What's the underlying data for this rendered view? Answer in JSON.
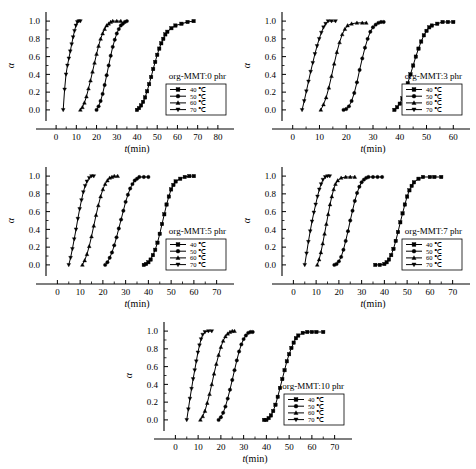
{
  "figure": {
    "axis_titles": {
      "x": "t(min)",
      "y": "α"
    },
    "x_unit_italic_prefix": "t",
    "panel_count": 5
  },
  "chart_data": [
    {
      "type": "line",
      "title": "org-MMT:0 phr",
      "xlabel": "t(min)",
      "ylabel": "α",
      "xlim": [
        -5,
        85
      ],
      "ylim": [
        -0.08,
        1.08
      ],
      "xticks": [
        0,
        10,
        20,
        30,
        40,
        50,
        60,
        70,
        80
      ],
      "yticks": [
        0.0,
        0.2,
        0.4,
        0.6,
        0.8,
        1.0
      ],
      "grid": false,
      "legend_position": "lower-right",
      "series": [
        {
          "name": "40 ℃",
          "marker": "square",
          "x": [
            40,
            41,
            42,
            43,
            44,
            45,
            46,
            47,
            48,
            49,
            50,
            51,
            52,
            53,
            54,
            55,
            57,
            59,
            62,
            65,
            68
          ],
          "y": [
            0.0,
            0.02,
            0.05,
            0.09,
            0.14,
            0.21,
            0.29,
            0.37,
            0.46,
            0.54,
            0.62,
            0.69,
            0.75,
            0.8,
            0.85,
            0.88,
            0.92,
            0.95,
            0.97,
            0.99,
            1.0
          ]
        },
        {
          "name": "50 ℃",
          "marker": "circle",
          "x": [
            20,
            21,
            22,
            23,
            24,
            25,
            26,
            27,
            28,
            29,
            30,
            31,
            32,
            33,
            34,
            35
          ],
          "y": [
            0.0,
            0.04,
            0.1,
            0.18,
            0.28,
            0.39,
            0.5,
            0.61,
            0.71,
            0.79,
            0.86,
            0.91,
            0.95,
            0.97,
            0.99,
            1.0
          ]
        },
        {
          "name": "60 ℃",
          "marker": "triangle-up",
          "x": [
            12,
            13,
            14,
            15,
            16,
            17,
            18,
            19,
            20,
            21,
            22,
            23,
            24,
            25,
            26,
            27,
            28,
            30,
            32
          ],
          "y": [
            0.0,
            0.03,
            0.08,
            0.15,
            0.24,
            0.33,
            0.43,
            0.53,
            0.63,
            0.72,
            0.8,
            0.86,
            0.91,
            0.95,
            0.97,
            0.99,
            1.0,
            1.0,
            1.0
          ]
        },
        {
          "name": "70 ℃",
          "marker": "triangle-down",
          "x": [
            3.5,
            4.2,
            4.9,
            5.6,
            6.3,
            7.0,
            7.7,
            8.4,
            9.1,
            9.8,
            10.5,
            11.2,
            12.0
          ],
          "y": [
            0.0,
            0.23,
            0.4,
            0.5,
            0.58,
            0.66,
            0.74,
            0.82,
            0.89,
            0.95,
            0.99,
            1.0,
            1.0
          ]
        }
      ]
    },
    {
      "type": "line",
      "title": "org-MMT:3 phr",
      "xlabel": "t(min)",
      "ylabel": "α",
      "xlim": [
        -4,
        64
      ],
      "ylim": [
        -0.08,
        1.08
      ],
      "xticks": [
        0,
        10,
        20,
        30,
        40,
        50,
        60
      ],
      "yticks": [
        0.0,
        0.2,
        0.4,
        0.6,
        0.8,
        1.0
      ],
      "grid": false,
      "legend_position": "lower-right",
      "series": [
        {
          "name": "40 ℃",
          "marker": "square",
          "x": [
            38,
            39,
            40,
            41,
            42,
            43,
            44,
            45,
            46,
            47,
            48,
            49,
            50,
            51,
            52,
            54,
            56,
            58,
            60
          ],
          "y": [
            0.0,
            0.03,
            0.07,
            0.13,
            0.21,
            0.3,
            0.4,
            0.5,
            0.6,
            0.69,
            0.77,
            0.84,
            0.89,
            0.93,
            0.95,
            0.97,
            0.99,
            0.99,
            0.99
          ]
        },
        {
          "name": "50 ℃",
          "marker": "circle",
          "x": [
            19,
            20,
            21,
            22,
            23,
            24,
            25,
            26,
            27,
            28,
            29,
            30,
            31,
            32,
            33,
            34
          ],
          "y": [
            0.0,
            0.01,
            0.04,
            0.1,
            0.19,
            0.31,
            0.45,
            0.58,
            0.7,
            0.8,
            0.88,
            0.93,
            0.96,
            0.98,
            0.99,
            0.99
          ]
        },
        {
          "name": "60 ℃",
          "marker": "triangle-up",
          "x": [
            10.5,
            11.5,
            12.5,
            13.5,
            14.5,
            15.5,
            16.5,
            17.5,
            18.5,
            19.5,
            20.5,
            22,
            24,
            26,
            27.5
          ],
          "y": [
            0.0,
            0.06,
            0.14,
            0.25,
            0.38,
            0.52,
            0.65,
            0.76,
            0.85,
            0.91,
            0.95,
            0.97,
            0.98,
            0.98,
            0.98
          ]
        },
        {
          "name": "70 ℃",
          "marker": "triangle-down",
          "x": [
            3.5,
            4.3,
            5.1,
            5.9,
            6.7,
            7.5,
            8.3,
            9.1,
            9.9,
            10.7,
            11.5,
            12.3,
            13.2,
            14.5,
            16
          ],
          "y": [
            0.0,
            0.1,
            0.21,
            0.32,
            0.43,
            0.53,
            0.63,
            0.72,
            0.8,
            0.87,
            0.93,
            0.97,
            1.0,
            1.0,
            1.0
          ]
        }
      ]
    },
    {
      "type": "line",
      "title": "org-MMT:5 phr",
      "xlabel": "t(min)",
      "ylabel": "α",
      "xlim": [
        -5,
        75
      ],
      "ylim": [
        -0.08,
        1.08
      ],
      "xticks": [
        0,
        10,
        20,
        30,
        40,
        50,
        60,
        70
      ],
      "yticks": [
        0.0,
        0.2,
        0.4,
        0.6,
        0.8,
        1.0
      ],
      "grid": false,
      "legend_position": "lower-right",
      "series": [
        {
          "name": "40 ℃",
          "marker": "square",
          "x": [
            38,
            39,
            40,
            41,
            42,
            43,
            44,
            45,
            46,
            47,
            48,
            49,
            50,
            51,
            52,
            54,
            56,
            58,
            60
          ],
          "y": [
            0.0,
            0.01,
            0.03,
            0.06,
            0.11,
            0.17,
            0.25,
            0.35,
            0.46,
            0.57,
            0.68,
            0.77,
            0.85,
            0.9,
            0.94,
            0.97,
            0.99,
            1.0,
            1.0
          ]
        },
        {
          "name": "50 ℃",
          "marker": "circle",
          "x": [
            21,
            22,
            23,
            24,
            25,
            26,
            27,
            28,
            29,
            30,
            31,
            32,
            33,
            34,
            35,
            36,
            38,
            40
          ],
          "y": [
            0.0,
            0.03,
            0.08,
            0.14,
            0.22,
            0.31,
            0.41,
            0.51,
            0.61,
            0.71,
            0.79,
            0.86,
            0.91,
            0.95,
            0.97,
            0.99,
            0.99,
            0.99
          ]
        },
        {
          "name": "60 ℃",
          "marker": "triangle-up",
          "x": [
            11,
            12,
            13,
            14,
            15,
            16,
            17,
            18,
            19,
            20,
            21,
            22,
            23,
            24,
            25,
            26.5
          ],
          "y": [
            0.0,
            0.05,
            0.12,
            0.21,
            0.32,
            0.44,
            0.56,
            0.67,
            0.77,
            0.85,
            0.91,
            0.95,
            0.98,
            0.99,
            1.0,
            1.0
          ]
        },
        {
          "name": "70 ℃",
          "marker": "triangle-down",
          "x": [
            5,
            5.8,
            6.6,
            7.4,
            8.2,
            9.0,
            9.8,
            10.6,
            11.4,
            12.2,
            13.0,
            14.0,
            15.0,
            16.0
          ],
          "y": [
            0.0,
            0.08,
            0.18,
            0.29,
            0.4,
            0.52,
            0.63,
            0.73,
            0.82,
            0.89,
            0.94,
            0.98,
            1.0,
            1.0
          ]
        }
      ]
    },
    {
      "type": "line",
      "title": "org-MMT:7 phr",
      "xlabel": "t(min)",
      "ylabel": "α",
      "xlim": [
        -5,
        75
      ],
      "ylim": [
        -0.08,
        1.08
      ],
      "xticks": [
        0,
        10,
        20,
        30,
        40,
        50,
        60,
        70
      ],
      "yticks": [
        0.0,
        0.2,
        0.4,
        0.6,
        0.8,
        1.0
      ],
      "grid": false,
      "legend_position": "lower-right",
      "series": [
        {
          "name": "40 ℃",
          "marker": "square",
          "x": [
            36,
            38,
            40,
            41,
            42,
            43,
            44,
            45,
            46,
            47,
            48,
            49,
            50,
            51,
            52,
            53,
            55,
            57,
            60,
            62,
            65
          ],
          "y": [
            0.0,
            0.0,
            0.01,
            0.03,
            0.06,
            0.11,
            0.18,
            0.27,
            0.37,
            0.48,
            0.58,
            0.68,
            0.77,
            0.84,
            0.89,
            0.93,
            0.97,
            0.99,
            0.99,
            0.99,
            0.99
          ]
        },
        {
          "name": "50 ℃",
          "marker": "circle",
          "x": [
            18,
            19,
            20,
            21,
            22,
            23,
            24,
            25,
            26,
            27,
            28,
            29,
            30,
            31,
            32,
            33,
            35,
            37,
            39
          ],
          "y": [
            0.0,
            0.01,
            0.04,
            0.09,
            0.17,
            0.27,
            0.38,
            0.5,
            0.61,
            0.72,
            0.81,
            0.88,
            0.93,
            0.96,
            0.98,
            0.99,
            0.99,
            0.99,
            0.99
          ]
        },
        {
          "name": "60 ℃",
          "marker": "triangle-up",
          "x": [
            10.5,
            11.3,
            12.1,
            12.9,
            13.7,
            14.5,
            15.3,
            16.1,
            16.9,
            17.7,
            18.5,
            19.5,
            21,
            23,
            25,
            27
          ],
          "y": [
            0.0,
            0.06,
            0.14,
            0.24,
            0.35,
            0.46,
            0.57,
            0.68,
            0.77,
            0.85,
            0.91,
            0.95,
            0.98,
            0.99,
            0.99,
            0.99
          ]
        },
        {
          "name": "70 ℃",
          "marker": "triangle-down",
          "x": [
            5,
            5.8,
            6.6,
            7.4,
            8.2,
            9.0,
            9.8,
            10.6,
            11.4,
            12.2,
            13.0,
            14.0,
            15.0,
            16.0
          ],
          "y": [
            0.0,
            0.13,
            0.26,
            0.38,
            0.49,
            0.59,
            0.68,
            0.77,
            0.85,
            0.91,
            0.96,
            0.99,
            1.0,
            1.0
          ]
        }
      ]
    },
    {
      "type": "line",
      "title": "org-MMT:10 phr",
      "xlabel": "t(min)",
      "ylabel": "α",
      "xlim": [
        -5,
        75
      ],
      "ylim": [
        -0.08,
        1.08
      ],
      "xticks": [
        0,
        10,
        20,
        30,
        40,
        50,
        60,
        70
      ],
      "yticks": [
        0.0,
        0.2,
        0.4,
        0.6,
        0.8,
        1.0
      ],
      "grid": false,
      "legend_position": "lower-right",
      "series": [
        {
          "name": "40 ℃",
          "marker": "square",
          "x": [
            39,
            40,
            41,
            42,
            43,
            44,
            45,
            46,
            47,
            48,
            49,
            50,
            51,
            52,
            53,
            54,
            56,
            58,
            60,
            62,
            65
          ],
          "y": [
            0.0,
            0.0,
            0.02,
            0.05,
            0.1,
            0.17,
            0.26,
            0.36,
            0.46,
            0.56,
            0.66,
            0.74,
            0.81,
            0.87,
            0.92,
            0.95,
            0.98,
            0.99,
            0.99,
            0.99,
            0.99
          ]
        },
        {
          "name": "50 ℃",
          "marker": "circle",
          "x": [
            19,
            20,
            21,
            22,
            23,
            24,
            25,
            26,
            27,
            28,
            29,
            30,
            31,
            32,
            33,
            34
          ],
          "y": [
            0.0,
            0.03,
            0.08,
            0.15,
            0.24,
            0.34,
            0.45,
            0.56,
            0.67,
            0.77,
            0.85,
            0.91,
            0.95,
            0.98,
            0.99,
            0.99
          ]
        },
        {
          "name": "60 ℃",
          "marker": "triangle-up",
          "x": [
            11,
            12,
            13,
            14,
            15,
            16,
            17,
            18,
            19,
            20,
            21,
            22,
            23,
            24,
            25,
            26
          ],
          "y": [
            0.0,
            0.04,
            0.1,
            0.19,
            0.29,
            0.4,
            0.52,
            0.63,
            0.73,
            0.82,
            0.89,
            0.94,
            0.97,
            0.99,
            1.0,
            1.0
          ]
        },
        {
          "name": "70 ℃",
          "marker": "triangle-down",
          "x": [
            5,
            5.7,
            6.4,
            7.1,
            7.8,
            8.5,
            9.2,
            9.9,
            10.6,
            11.3,
            12.0,
            13.0,
            14.5,
            16
          ],
          "y": [
            0.0,
            0.12,
            0.24,
            0.35,
            0.46,
            0.56,
            0.66,
            0.76,
            0.84,
            0.91,
            0.96,
            0.99,
            1.0,
            1.0
          ]
        }
      ]
    }
  ],
  "legend_entries": [
    "40 ℃",
    "50 ℃",
    "60 ℃",
    "70 ℃"
  ]
}
